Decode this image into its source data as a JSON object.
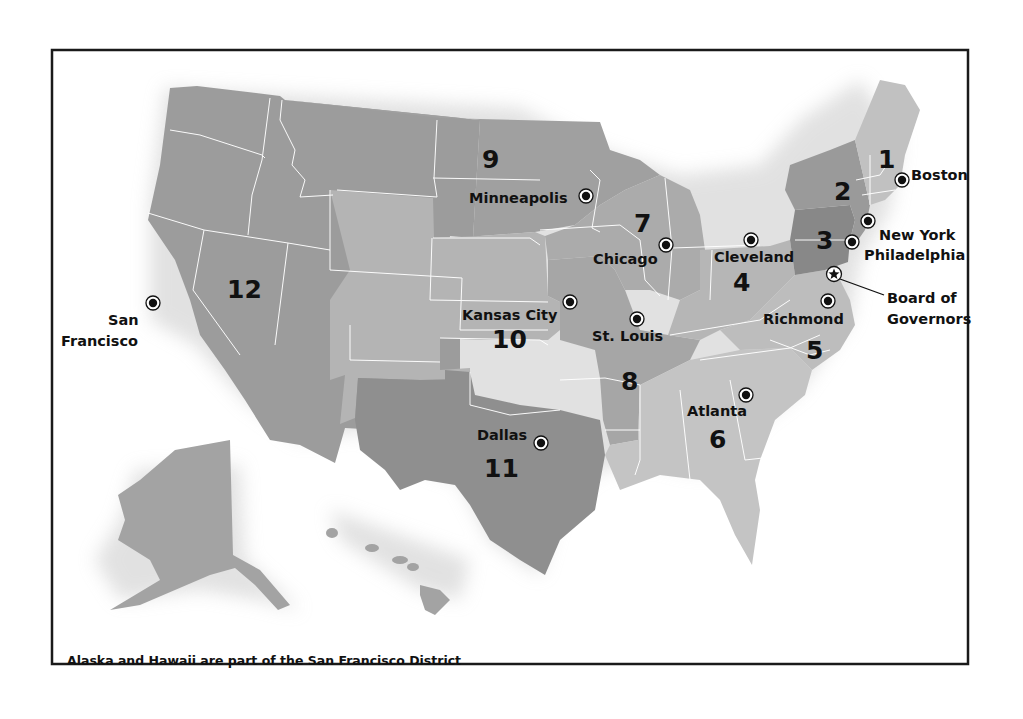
{
  "map": {
    "title": "Federal Reserve Districts",
    "caption": "Alaska and Hawaii are part of the San Francisco District",
    "colors": {
      "border": "#1a1a1a",
      "state_lines": "#ffffff",
      "district_dark": "#8e8e8e",
      "district_mid": "#a3a3a3",
      "district_light": "#b8b8b8",
      "district_lighter": "#c8c8c8",
      "text": "#111111"
    },
    "districts": [
      {
        "number": "1",
        "city": "Boston"
      },
      {
        "number": "2",
        "city": "New York"
      },
      {
        "number": "3",
        "city": "Philadelphia"
      },
      {
        "number": "4",
        "city": "Cleveland"
      },
      {
        "number": "5",
        "city": "Richmond"
      },
      {
        "number": "6",
        "city": "Atlanta"
      },
      {
        "number": "7",
        "city": "Chicago"
      },
      {
        "number": "8",
        "city": "St. Louis"
      },
      {
        "number": "9",
        "city": "Minneapolis"
      },
      {
        "number": "10",
        "city": "Kansas City"
      },
      {
        "number": "11",
        "city": "Dallas"
      },
      {
        "number": "12",
        "city": "San Francisco"
      }
    ],
    "labels": {
      "sf_line1": "San",
      "sf_line2": "Francisco",
      "board_line1": "Board of",
      "board_line2": "Governors"
    },
    "legend": {
      "reserve_bank_marker": "circle-dot-icon",
      "board_marker": "star-icon"
    }
  }
}
